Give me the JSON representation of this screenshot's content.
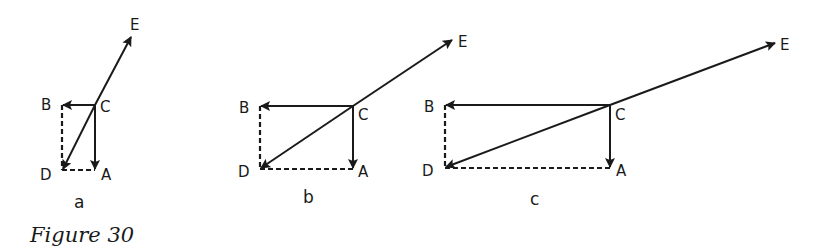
{
  "caption": "Figure 30",
  "colors": {
    "ink": "#1a1a1a",
    "background": "#ffffff"
  },
  "panels": [
    {
      "id": "a",
      "label": "a",
      "points": {
        "A": {
          "label": "A",
          "x": 95,
          "y": 170
        },
        "B": {
          "label": "B",
          "x": 62,
          "y": 105
        },
        "C": {
          "label": "C",
          "x": 95,
          "y": 105
        },
        "D": {
          "label": "D",
          "x": 62,
          "y": 170
        },
        "E": {
          "label": "E",
          "x": 131,
          "y": 37
        }
      },
      "vectors": [
        "C→A",
        "C→B",
        "C→D",
        "C→E"
      ],
      "dashed": [
        "B–D",
        "D–A"
      ]
    },
    {
      "id": "b",
      "label": "b",
      "points": {
        "A": {
          "label": "A",
          "x": 353,
          "y": 169
        },
        "B": {
          "label": "B",
          "x": 260,
          "y": 106
        },
        "C": {
          "label": "C",
          "x": 353,
          "y": 106
        },
        "D": {
          "label": "D",
          "x": 260,
          "y": 169
        },
        "E": {
          "label": "E",
          "x": 452,
          "y": 40
        }
      },
      "vectors": [
        "C→A",
        "C→B",
        "C→D",
        "C→E"
      ],
      "dashed": [
        "B–D",
        "D–A"
      ]
    },
    {
      "id": "c",
      "label": "c",
      "points": {
        "A": {
          "label": "A",
          "x": 610,
          "y": 168
        },
        "B": {
          "label": "B",
          "x": 445,
          "y": 105
        },
        "C": {
          "label": "C",
          "x": 610,
          "y": 105
        },
        "D": {
          "label": "D",
          "x": 445,
          "y": 168
        },
        "E": {
          "label": "E",
          "x": 775,
          "y": 43
        }
      },
      "vectors": [
        "C→A",
        "C→B",
        "C→D",
        "C→E"
      ],
      "dashed": [
        "B–D",
        "D–A"
      ]
    }
  ]
}
